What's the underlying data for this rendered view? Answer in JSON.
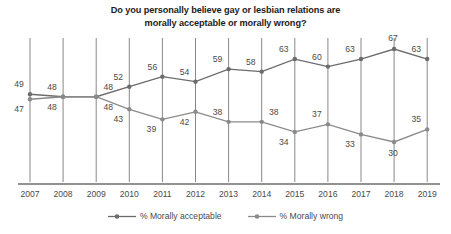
{
  "chart_data": {
    "type": "line",
    "title": "Do you personally believe gay or lesbian relations are morally acceptable or morally wrong?",
    "title_line1": "Do you personally believe gay or lesbian relations are",
    "title_line2": "morally acceptable or morally wrong?",
    "xlabel": "",
    "ylabel": "",
    "ylim": [
      25,
      70
    ],
    "grid": "vertical",
    "legend_position": "bottom",
    "categories": [
      "2007",
      "2008",
      "2009",
      "2010",
      "2011",
      "2012",
      "2013",
      "2014",
      "2015",
      "2016",
      "2017",
      "2018",
      "2019"
    ],
    "series": [
      {
        "name": "% Morally acceptable",
        "color": "#6b6b6b",
        "values": [
          49,
          48,
          48,
          52,
          56,
          54,
          59,
          58,
          63,
          60,
          63,
          67,
          63
        ]
      },
      {
        "name": "% Morally wrong",
        "color": "#8a8a8a",
        "values": [
          47,
          48,
          48,
          43,
          39,
          42,
          38,
          38,
          34,
          37,
          33,
          30,
          35
        ]
      }
    ]
  },
  "legend": {
    "items": [
      {
        "label": "% Morally acceptable"
      },
      {
        "label": "% Morally wrong"
      }
    ]
  },
  "colors": {
    "acceptable_line": "#6b6b6b",
    "wrong_line": "#8a8a8a",
    "gridline": "#7a7a7a",
    "axis": "#6e6e6e",
    "label_text": "#4a4a4a",
    "title_text": "#1c1c1c",
    "background": "#ffffff"
  }
}
